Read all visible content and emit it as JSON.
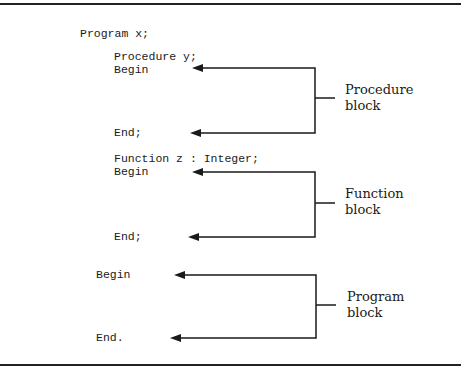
{
  "code": {
    "program_header": "Program x;",
    "procedure_header": "Procedure y;",
    "procedure_begin": "Begin",
    "procedure_end": "End;",
    "function_header": "Function z : Integer;",
    "function_begin": "Begin",
    "function_end": "End;",
    "program_begin": "Begin",
    "program_end": "End."
  },
  "labels": {
    "procedure": [
      "Procedure",
      "block"
    ],
    "function": [
      "Function",
      "block"
    ],
    "program": [
      "Program",
      "block"
    ]
  },
  "colors": {
    "ink": "#1a1a1a",
    "background": "#ffffff"
  }
}
